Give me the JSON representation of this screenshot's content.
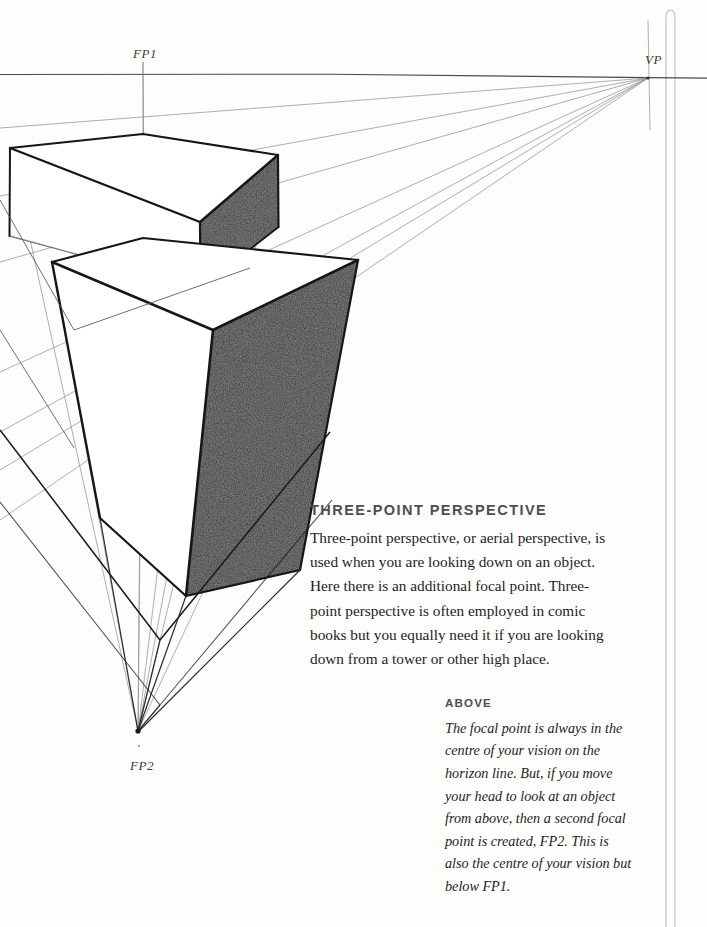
{
  "page": {
    "background_color": "#fdfdfc",
    "ink_color": "#1d1d1b",
    "heading_color": "#4e4e4e",
    "shade_color": "#3b3b3b"
  },
  "diagram": {
    "type": "three-point-perspective-construction",
    "labels": {
      "fp1": "FP1",
      "vp": "VP",
      "fp2": "FP2"
    },
    "points": {
      "fp1": [
        143,
        73
      ],
      "vp": [
        648,
        78
      ],
      "fp2": [
        138,
        731
      ]
    },
    "horizon_line_y": 73,
    "fp1_vertical_x": 143,
    "page_rule_x": [
      665,
      672
    ],
    "boxes": [
      {
        "name": "upper-box",
        "top_face": [
          [
            10,
            148
          ],
          [
            143,
            134
          ],
          [
            278,
            155
          ],
          [
            200,
            222
          ]
        ],
        "shaded_face": [
          [
            200,
            222
          ],
          [
            278,
            155
          ],
          [
            278,
            226
          ],
          [
            200,
            287
          ]
        ]
      },
      {
        "name": "lower-box",
        "top_face": [
          [
            52,
            262
          ],
          [
            143,
            238
          ],
          [
            358,
            260
          ],
          [
            213,
            330
          ]
        ],
        "shaded_face": [
          [
            213,
            330
          ],
          [
            358,
            260
          ],
          [
            300,
            570
          ],
          [
            185,
            595
          ]
        ]
      }
    ]
  },
  "article": {
    "heading": "THREE-POINT PERSPECTIVE",
    "body_lines": [
      "Three-point perspective, or aerial perspective, is",
      "used when you are looking down on an object.",
      "Here there is an additional focal point. Three-",
      "point perspective is often employed in comic",
      "books but you equally need it if you are looking",
      "down from a tower or other high place."
    ]
  },
  "caption": {
    "heading": "ABOVE",
    "body_lines": [
      "The focal point is always in the",
      "centre of your vision on the",
      "horizon line. But, if you move",
      "your head to look at an object",
      "from above, then a second focal",
      "point is created, FP2. This is",
      "also the centre of your vision but",
      "below FP1."
    ]
  }
}
